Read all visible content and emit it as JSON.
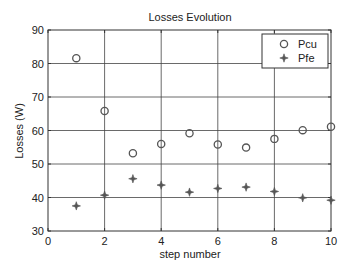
{
  "chart_data": {
    "type": "scatter",
    "title": "Losses Evolution",
    "xlabel": "step number",
    "ylabel": "Losses (W)",
    "xlim": [
      0,
      10
    ],
    "ylim": [
      30,
      90
    ],
    "xticks": [
      0,
      2,
      4,
      6,
      8,
      10
    ],
    "yticks": [
      30,
      40,
      50,
      60,
      70,
      80,
      90
    ],
    "grid": true,
    "legend_position": "upper right",
    "x": [
      1,
      2,
      3,
      4,
      5,
      6,
      7,
      8,
      9,
      10
    ],
    "series": [
      {
        "name": "Pcu",
        "marker": "circle",
        "color": "#555555",
        "values": [
          81.6,
          65.8,
          53.2,
          56.0,
          59.2,
          55.8,
          54.9,
          57.5,
          60.1,
          61.1
        ]
      },
      {
        "name": "Pfe",
        "marker": "star",
        "color": "#555555",
        "values": [
          37.5,
          40.7,
          45.6,
          43.7,
          41.6,
          42.7,
          43.1,
          41.8,
          39.9,
          39.2
        ]
      }
    ]
  }
}
